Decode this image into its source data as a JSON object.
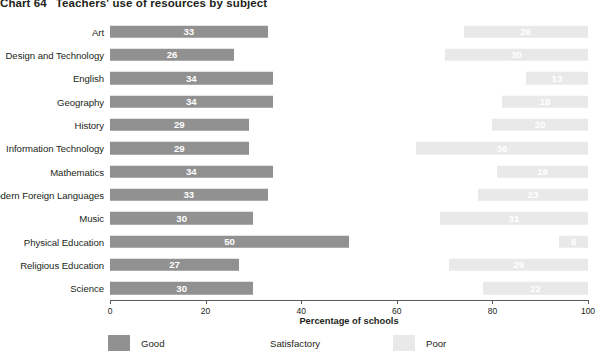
{
  "chart_data": {
    "type": "bar",
    "title": "Teachers' use of resources by subject",
    "title_number": "Chart 64",
    "xlabel": "Percentage of schools",
    "ylabel": "",
    "xlim": [
      0,
      100
    ],
    "xticks": [
      0,
      20,
      40,
      60,
      80,
      100
    ],
    "xticklabels": [
      "0",
      "20",
      "40",
      "60",
      "80",
      "100"
    ],
    "grid": false,
    "orientation": "horizontal",
    "stacked": true,
    "legend_position": "bottom-left",
    "categories": [
      "Art",
      "Design and Technology",
      "English",
      "Geography",
      "History",
      "Information Technology",
      "Mathematics",
      "Modern Foreign Languages",
      "Music",
      "Physical Education",
      "Religious Education",
      "Science"
    ],
    "series": [
      {
        "name": "Good",
        "color": "#919191",
        "values": [
          33,
          26,
          34,
          34,
          29,
          29,
          34,
          33,
          30,
          50,
          27,
          30
        ]
      },
      {
        "name": "Satisfactory",
        "color": "#ffffff",
        "values": [
          41,
          44,
          53,
          48,
          51,
          35,
          47,
          44,
          39,
          44,
          44,
          48
        ]
      },
      {
        "name": "Poor",
        "color": "#e9e9e9",
        "values": [
          26,
          30,
          13,
          18,
          20,
          36,
          19,
          23,
          31,
          6,
          29,
          22
        ]
      }
    ]
  },
  "legend": {
    "items": [
      {
        "label": "Good",
        "color": "#919191"
      },
      {
        "label": "Satisfactory",
        "color": "#ffffff"
      },
      {
        "label": "Poor",
        "color": "#e9e9e9"
      }
    ]
  }
}
